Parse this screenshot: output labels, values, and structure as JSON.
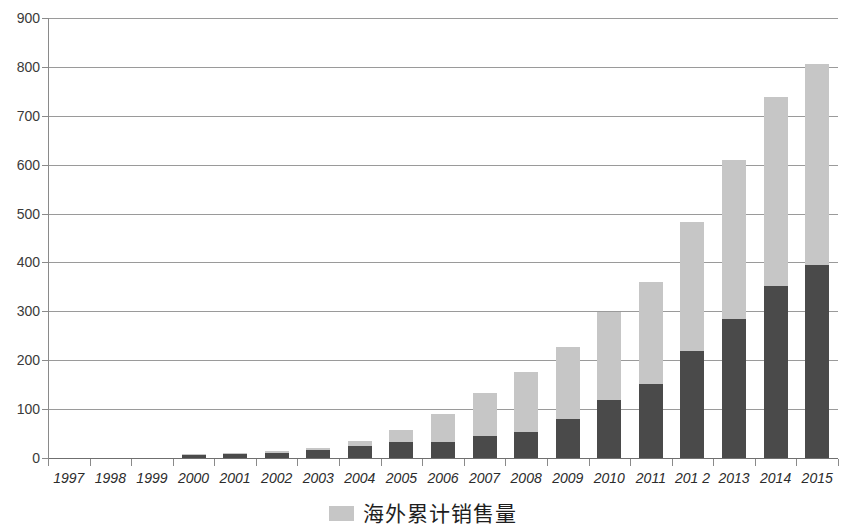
{
  "chart_data": {
    "type": "bar",
    "subtype": "stacked-vertical",
    "title": "",
    "xlabel": "",
    "ylabel": "",
    "ylim": [
      0,
      900
    ],
    "ytick_step": 100,
    "yticks": [
      900,
      800,
      700,
      600,
      500,
      400,
      300,
      200,
      100,
      0
    ],
    "grid": true,
    "grid_axis": "y",
    "legend_position": "bottom-center",
    "categories": [
      "1997",
      "1998",
      "1999",
      "2000",
      "2001",
      "2002",
      "2003",
      "2004",
      "2005",
      "2006",
      "2007",
      "2008",
      "2009",
      "2010",
      "2011",
      "201 2",
      "2013",
      "2014",
      "2015"
    ],
    "series": [
      {
        "name": "",
        "color": "#4a4a4a",
        "stack_order": 0,
        "values": [
          0,
          0,
          0,
          7,
          8,
          11,
          16,
          25,
          33,
          33,
          44,
          54,
          79,
          118,
          151,
          219,
          284,
          352,
          394
        ]
      },
      {
        "name": "海外累计销售量",
        "color": "#c6c6c6",
        "stack_order": 1,
        "values": [
          0,
          0,
          0,
          1,
          2,
          3,
          5,
          10,
          24,
          56,
          89,
          122,
          149,
          180,
          210,
          264,
          326,
          386,
          411
        ]
      }
    ],
    "totals": [
      0,
      0,
      0,
      8,
      10,
      14,
      21,
      35,
      57,
      89,
      133,
      176,
      228,
      298,
      361,
      483,
      610,
      738,
      805
    ],
    "legend_entries": [
      {
        "label": "海外累计销售量",
        "color": "#c6c6c6"
      }
    ]
  },
  "colors": {
    "series_dark": "#4a4a4a",
    "series_light": "#c6c6c6",
    "gridline": "#9a9a9a",
    "axis": "#8a8a8a",
    "text": "#2b2b2b",
    "background": "#ffffff"
  },
  "legend": {
    "label": "海外累计销售量"
  },
  "title_sliver": {
    "text": "·····"
  }
}
